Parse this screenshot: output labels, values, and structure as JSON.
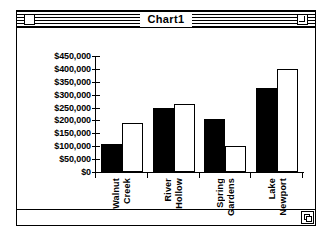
{
  "window": {
    "title": "Chart1",
    "close_box_name": "close-box",
    "zoom_box_name": "zoom-box",
    "grow_box_name": "grow-box"
  },
  "chart_data": {
    "type": "bar",
    "title": "",
    "xlabel": "",
    "ylabel": "",
    "grid": false,
    "legend": "none",
    "categories": [
      "Walnut Creek",
      "River Hollow",
      "Spring Gardens",
      "Lake Newport"
    ],
    "ylim": [
      0,
      450000
    ],
    "ytick_labels": [
      "$450,000",
      "$400,000",
      "$350,000",
      "$300,000",
      "$250,000",
      "$200,000",
      "$150,000",
      "$100,000",
      "$50,000",
      "$0"
    ],
    "ytick_values": [
      450000,
      400000,
      350000,
      300000,
      250000,
      200000,
      150000,
      100000,
      50000,
      0
    ],
    "series": [
      {
        "name": "Series 1",
        "style": "filled-black",
        "color": "#000000",
        "values": [
          110000,
          250000,
          205000,
          325000
        ]
      },
      {
        "name": "Series 2",
        "style": "hollow-white",
        "color": "#ffffff",
        "values": [
          190000,
          262000,
          100000,
          400000
        ]
      }
    ]
  }
}
